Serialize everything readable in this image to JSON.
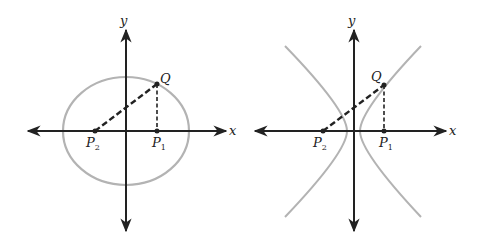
{
  "figures": [
    {
      "name": "ellipse",
      "axis_labels": {
        "x": "x",
        "y": "y"
      },
      "points": {
        "Q": "Q",
        "P1": "P",
        "P1_sub": "1",
        "P2": "P",
        "P2_sub": "2"
      },
      "curve_color": "#b3b3b3"
    },
    {
      "name": "hyperbola",
      "axis_labels": {
        "x": "x",
        "y": "y"
      },
      "points": {
        "Q": "Q",
        "P1": "P",
        "P1_sub": "1",
        "P2": "P",
        "P2_sub": "2"
      },
      "curve_color": "#b3b3b3"
    }
  ],
  "colors": {
    "axis": "#222222",
    "curve": "#b3b3b3",
    "background": "#ffffff"
  }
}
